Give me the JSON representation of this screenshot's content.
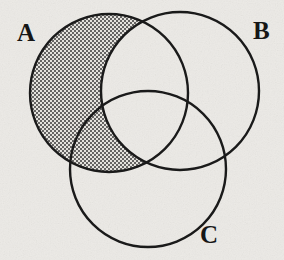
{
  "figure": {
    "kind": "venn-diagram",
    "caption_text": "",
    "background_color": "#ebeae6",
    "stroke_color": "#1a1a1a",
    "shade_color": "#3a3a3a",
    "shade_pattern": "stipple-dots"
  },
  "labels": {
    "a": "A",
    "b": "B",
    "c": "C"
  },
  "chart_data": {
    "type": "venn",
    "title": "",
    "sets": [
      {
        "name": "A",
        "cx": 109,
        "cy": 93,
        "r": 79
      },
      {
        "name": "B",
        "cx": 180,
        "cy": 91,
        "r": 79
      },
      {
        "name": "C",
        "cx": 148,
        "cy": 169,
        "r": 78
      }
    ],
    "shaded_regions": [
      "A-only",
      "A∩C-not-B"
    ],
    "shaded_expression": "A \\ B",
    "unshaded_regions": [
      "B-only",
      "C-only",
      "A∩B-not-C",
      "B∩C-not-A",
      "A∩B∩C",
      "outside"
    ],
    "label_positions": [
      {
        "name": "A",
        "x": 17,
        "y": 20
      },
      {
        "name": "B",
        "x": 253,
        "y": 18
      },
      {
        "name": "C",
        "x": 200,
        "y": 222
      }
    ],
    "legend": "none",
    "grid": false,
    "xlabel": "",
    "ylabel": ""
  }
}
